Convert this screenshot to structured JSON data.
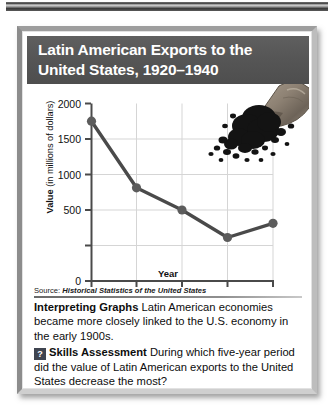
{
  "panel": {
    "title": "Latin American Exports to the\nUnited States, 1920–1940",
    "source_prefix": "Source: ",
    "source_title": "Historical Statistics of the United States"
  },
  "illustration": {
    "name": "coffee-sack-with-beans",
    "description": "burlap sack spilling dark coffee beans"
  },
  "chart_data": {
    "type": "line",
    "xlabel": "Year",
    "ylabel": "Value (in millions of dollars)",
    "categories": [
      1920,
      1925,
      1930,
      1935,
      1940
    ],
    "values": [
      1800,
      1050,
      800,
      490,
      650
    ],
    "xlim": [
      1920,
      1940
    ],
    "ylim": [
      0,
      2000
    ],
    "ytick_labels": [
      "0",
      "500",
      "1000",
      "1500",
      "2000"
    ],
    "yticks": [
      0,
      500,
      1000,
      1500,
      2000
    ],
    "xtick_labels": [
      "1920",
      "1925",
      "1930",
      "1935",
      "1940"
    ],
    "grid": true,
    "legend": "none",
    "line_color": "#4a4a4a",
    "marker_color": "#5a5a5a",
    "grid_color": "#d5d5d5"
  },
  "interpreting": {
    "heading": "Interpreting Graphs",
    "text": "Latin American economies became more closely linked to the U.S. economy in the early 1900s."
  },
  "skills": {
    "badge": "?",
    "heading": "Skills Assessment",
    "text": "During which five-year period did the value of Latin American exports to the United States decrease the most?"
  },
  "colors": {
    "title_band": "#565656",
    "badge": "#3f4450",
    "frame": "#9d9d9d"
  }
}
